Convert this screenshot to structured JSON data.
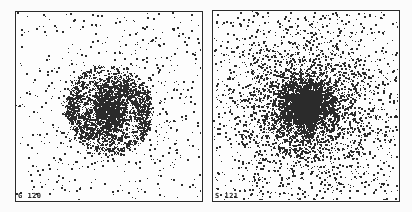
{
  "figure": {
    "background": "#fbfbfb",
    "dot_color": "#2b2b2b"
  },
  "chart_data": [
    {
      "type": "scatter",
      "title": "",
      "label": "G 120",
      "xlabel": "",
      "ylabel": "",
      "grid": false,
      "description": "Particle distribution showing a compact rotating disk with spiral-arm structure and sparse surrounding halo",
      "box": {
        "x": 15,
        "y": 11,
        "w": 188,
        "h": 191
      },
      "center": [
        0.5,
        0.52
      ],
      "components": [
        {
          "kind": "spiral_disk",
          "count": 2600,
          "radius": 0.2,
          "arms": 2,
          "twist": 3.2
        },
        {
          "kind": "core",
          "count": 500,
          "radius": 0.05
        },
        {
          "kind": "halo",
          "count": 600,
          "radius": 0.5
        },
        {
          "kind": "uniform",
          "count": 280
        }
      ]
    },
    {
      "type": "scatter",
      "title": "",
      "label": "S 121",
      "xlabel": "",
      "ylabel": "",
      "grid": false,
      "description": "Spherical particle distribution strongly concentrated toward the center, extended halo filling the frame",
      "box": {
        "x": 212,
        "y": 10,
        "w": 188,
        "h": 192
      },
      "center": [
        0.5,
        0.5
      ],
      "components": [
        {
          "kind": "core",
          "count": 1400,
          "radius": 0.06
        },
        {
          "kind": "halo",
          "count": 3600,
          "radius": 0.3
        },
        {
          "kind": "uniform",
          "count": 700
        }
      ]
    }
  ]
}
